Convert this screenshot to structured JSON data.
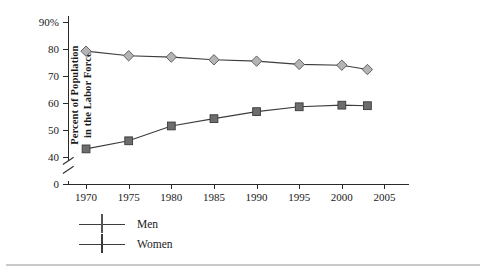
{
  "axes": {
    "ylabel_line1": "Percent of Population",
    "ylabel_line2": "in the Labor Force",
    "y_ticks": [
      "90%",
      "80",
      "70",
      "60",
      "50",
      "40",
      "0"
    ],
    "x_ticks": [
      "1970",
      "1975",
      "1980",
      "1985",
      "1990",
      "1995",
      "2000",
      "2005"
    ]
  },
  "legend": [
    {
      "label": "Men",
      "marker": "diamond-marker",
      "color": "#b4b4b4"
    },
    {
      "label": "Women",
      "marker": "square-marker",
      "color": "#6d6d6d"
    }
  ],
  "chart_data": {
    "type": "line",
    "title": "",
    "xlabel": "",
    "ylabel": "Percent of Population in the Labor Force",
    "x": [
      1970,
      1975,
      1980,
      1985,
      1990,
      1995,
      2000,
      2003
    ],
    "xlim": [
      1968,
      2006
    ],
    "ylim": [
      40,
      90
    ],
    "y_axis_break": true,
    "y_axis_break_between": [
      0,
      40
    ],
    "y_ticks": [
      40,
      50,
      60,
      70,
      80,
      90
    ],
    "x_ticks": [
      1970,
      1975,
      1980,
      1985,
      1990,
      1995,
      2000,
      2005
    ],
    "grid": false,
    "legend_position": "below-left",
    "series": [
      {
        "name": "Men",
        "marker": "diamond",
        "color": "#b4b4b4",
        "values": [
          79.2,
          77.5,
          77.0,
          76.0,
          75.5,
          74.3,
          74.0,
          72.4
        ]
      },
      {
        "name": "Women",
        "marker": "square",
        "color": "#6d6d6d",
        "values": [
          43.0,
          46.0,
          51.5,
          54.2,
          56.8,
          58.6,
          59.2,
          59.0
        ]
      }
    ]
  }
}
